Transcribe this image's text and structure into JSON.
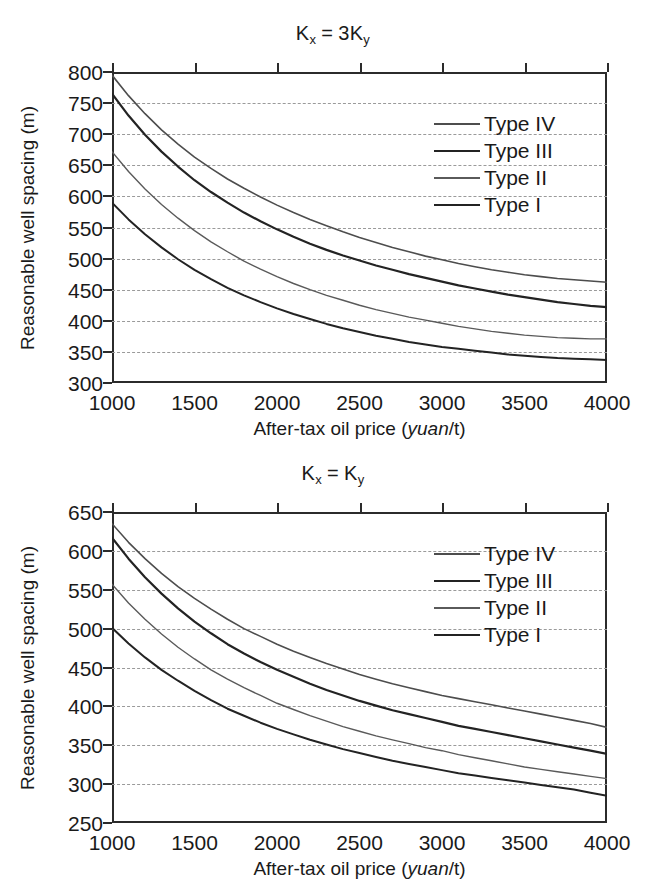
{
  "figure": {
    "background": "#ffffff",
    "axis_color": "#2b2b2b",
    "grid_color": "#9a9a9a"
  },
  "panels": [
    {
      "id": "panel-top",
      "title_prefix": "K",
      "title_sub1": "x",
      "title_eq": "=",
      "title_mid": "3K",
      "title_sub2": "y",
      "title_plain": "Kx = 3Ky"
    },
    {
      "id": "panel-bottom",
      "title_prefix": "K",
      "title_sub1": "x",
      "title_eq": "=",
      "title_mid": "K",
      "title_sub2": "y",
      "title_plain": "Kx = Ky"
    }
  ],
  "axis_titles": {
    "y": "Reasonable well spacing (m)",
    "x_before": "After-tax oil price (",
    "x_italic": "yuan",
    "x_after": "/t)",
    "x_plain": "After-tax oil price (yuan/t)"
  },
  "legend_labels": [
    "Type IV",
    "Type III",
    "Type II",
    "Type I"
  ],
  "chart_data": [
    {
      "type": "line",
      "title": "Kx = 3Ky",
      "xlabel": "After-tax oil price (yuan/t)",
      "ylabel": "Reasonable well spacing (m)",
      "xlim": [
        1000,
        4000
      ],
      "ylim": [
        300,
        800
      ],
      "xticks": [
        1000,
        1500,
        2000,
        2500,
        3000,
        3500,
        4000
      ],
      "yticks": [
        300,
        350,
        400,
        450,
        500,
        550,
        600,
        650,
        700,
        750,
        800
      ],
      "grid": "horizontal-dashed",
      "legend_position": "upper-right-inside",
      "x": [
        1000,
        1100,
        1200,
        1300,
        1400,
        1500,
        1600,
        1700,
        1800,
        1900,
        2000,
        2100,
        2200,
        2300,
        2400,
        2500,
        2600,
        2700,
        2800,
        2900,
        3000,
        3100,
        3200,
        3300,
        3400,
        3500,
        3600,
        3700,
        3800,
        3900,
        4000
      ],
      "series": [
        {
          "name": "Type IV",
          "line_style": "solid",
          "color": "#4d4d4d",
          "width": 1.6,
          "values": [
            795,
            762,
            733,
            707,
            684,
            663,
            645,
            628,
            613,
            599,
            586,
            574,
            563,
            553,
            543,
            534,
            526,
            518,
            511,
            504,
            498,
            492,
            487,
            482,
            478,
            474,
            471,
            468,
            466,
            464,
            462
          ]
        },
        {
          "name": "Type III",
          "line_style": "solid",
          "color": "#232323",
          "width": 2.2,
          "values": [
            765,
            730,
            699,
            672,
            648,
            626,
            607,
            590,
            574,
            560,
            547,
            535,
            524,
            514,
            505,
            497,
            489,
            482,
            475,
            469,
            463,
            457,
            452,
            447,
            442,
            438,
            434,
            430,
            427,
            424,
            422
          ]
        },
        {
          "name": "Type II",
          "line_style": "solid",
          "color": "#5a5a5a",
          "width": 1.4,
          "values": [
            672,
            640,
            612,
            587,
            565,
            545,
            527,
            511,
            496,
            483,
            471,
            460,
            450,
            441,
            433,
            425,
            418,
            412,
            406,
            401,
            396,
            391,
            387,
            383,
            380,
            377,
            375,
            373,
            372,
            371,
            371
          ]
        },
        {
          "name": "Type I",
          "line_style": "solid",
          "color": "#232323",
          "width": 2.0,
          "values": [
            590,
            563,
            539,
            518,
            499,
            482,
            467,
            453,
            441,
            430,
            420,
            411,
            403,
            395,
            388,
            382,
            376,
            371,
            366,
            362,
            358,
            355,
            352,
            349,
            346,
            344,
            342,
            340,
            339,
            338,
            337
          ]
        }
      ]
    },
    {
      "type": "line",
      "title": "Kx = Ky",
      "xlabel": "After-tax oil price (yuan/t)",
      "ylabel": "Reasonable well spacing (m)",
      "xlim": [
        1000,
        4000
      ],
      "ylim": [
        250,
        650
      ],
      "xticks": [
        1000,
        1500,
        2000,
        2500,
        3000,
        3500,
        4000
      ],
      "yticks": [
        250,
        300,
        350,
        400,
        450,
        500,
        550,
        600,
        650
      ],
      "grid": "horizontal-dashed",
      "legend_position": "upper-right-inside",
      "x": [
        1000,
        1100,
        1200,
        1300,
        1400,
        1500,
        1600,
        1700,
        1800,
        1900,
        2000,
        2100,
        2200,
        2300,
        2400,
        2500,
        2600,
        2700,
        2800,
        2900,
        3000,
        3100,
        3200,
        3300,
        3400,
        3500,
        3600,
        3700,
        3800,
        3900,
        4000
      ],
      "series": [
        {
          "name": "Type IV",
          "line_style": "solid",
          "color": "#4d4d4d",
          "width": 1.6,
          "values": [
            635,
            611,
            590,
            571,
            554,
            539,
            525,
            512,
            500,
            490,
            480,
            471,
            463,
            455,
            448,
            441,
            435,
            429,
            424,
            419,
            414,
            410,
            406,
            402,
            398,
            394,
            390,
            386,
            382,
            378,
            373
          ]
        },
        {
          "name": "Type III",
          "line_style": "solid",
          "color": "#232323",
          "width": 2.2,
          "values": [
            617,
            590,
            566,
            545,
            526,
            509,
            494,
            480,
            468,
            457,
            447,
            438,
            429,
            421,
            414,
            407,
            401,
            395,
            390,
            385,
            380,
            375,
            371,
            367,
            363,
            359,
            355,
            351,
            347,
            343,
            339
          ]
        },
        {
          "name": "Type II",
          "line_style": "solid",
          "color": "#5a5a5a",
          "width": 1.4,
          "values": [
            557,
            533,
            512,
            493,
            476,
            461,
            447,
            435,
            424,
            414,
            404,
            396,
            388,
            381,
            374,
            368,
            362,
            357,
            352,
            347,
            343,
            338,
            334,
            330,
            326,
            322,
            319,
            316,
            313,
            310,
            307
          ]
        },
        {
          "name": "Type I",
          "line_style": "solid",
          "color": "#232323",
          "width": 2.0,
          "values": [
            501,
            481,
            463,
            447,
            433,
            420,
            408,
            397,
            388,
            379,
            371,
            364,
            357,
            351,
            345,
            340,
            335,
            330,
            326,
            322,
            318,
            314,
            311,
            308,
            305,
            302,
            299,
            296,
            293,
            289,
            285
          ]
        }
      ]
    }
  ]
}
